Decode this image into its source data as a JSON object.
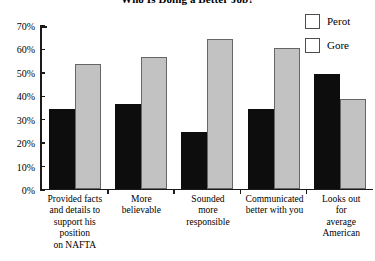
{
  "chart_data": {
    "type": "bar",
    "title": "Who Is Doing a Better Job?",
    "xlabel": "",
    "ylabel": "",
    "ylim": [
      0,
      70
    ],
    "ytick_labels": [
      "70%",
      "60%",
      "50%",
      "40%",
      "30%",
      "20%",
      "10%",
      "0%"
    ],
    "ytick_values": [
      70,
      60,
      50,
      40,
      30,
      20,
      10,
      0
    ],
    "grid": false,
    "legend_position": "top-right",
    "categories": [
      "Provided facts and details to support his position on NAFTA",
      "More believable",
      "Sounded more responsible",
      "Communicated better with you",
      "Looks out for average American"
    ],
    "category_lines": [
      [
        "Provided facts",
        "and details to",
        "support his",
        "position",
        "on NAFTA"
      ],
      [
        "More",
        "believable"
      ],
      [
        "Sounded",
        "more",
        "responsible"
      ],
      [
        "Communicated",
        "better with you"
      ],
      [
        "Looks out",
        "for",
        "average",
        "American"
      ]
    ],
    "series": [
      {
        "name": "Perot",
        "color": "#0d0d0d",
        "values": [
          34,
          36,
          24,
          34,
          49
        ]
      },
      {
        "name": "Gore",
        "color": "#c2c2c2",
        "values": [
          53,
          56,
          64,
          60,
          38
        ]
      }
    ]
  },
  "legend": {
    "items": [
      {
        "label": "Perot",
        "color": "#0d0d0d",
        "border": "#4d4d4d"
      },
      {
        "label": "Gore",
        "color": "#c2c2c2",
        "border": "#666666"
      }
    ]
  }
}
